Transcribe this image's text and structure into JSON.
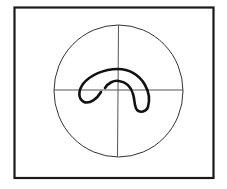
{
  "diagram": {
    "frame": {
      "x": 14,
      "y": 7,
      "width": 199,
      "height": 171,
      "stroke": "#1a1a1a",
      "stroke_width": 2.2
    },
    "circle": {
      "cx": 118,
      "cy": 91,
      "rx": 64.5,
      "ry": 66,
      "stroke": "#333333",
      "stroke_width": 1
    },
    "crosshair": {
      "stroke": "#555555",
      "stroke_width": 1
    },
    "curve": {
      "stroke": "#111111",
      "stroke_width": 2.6,
      "description": "bold hooked kidney-shaped curve overlapping the crosshair center"
    }
  }
}
